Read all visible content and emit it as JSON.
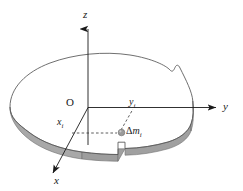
{
  "figure": {
    "kind": "3d-coordinate-diagram",
    "background_color": "#ffffff",
    "outline_color": "#4d4d4d",
    "axis_color": "#1a1a1a",
    "slab_edge_fill": "#a8a8a8",
    "slab_edge_shadow": "#7d7d7d",
    "point_marker_color": "#9a9a9a",
    "dashed_color": "#3c3c3c"
  },
  "axes": {
    "z": {
      "label": "z",
      "direction": "up"
    },
    "y": {
      "label": "y",
      "direction": "right"
    },
    "x": {
      "label": "x",
      "direction": "down-left"
    },
    "origin": {
      "label": "O"
    }
  },
  "annotations": {
    "x_coordinate": {
      "label": "x",
      "subscript": "i"
    },
    "y_coordinate": {
      "label": "y",
      "subscript": "i"
    },
    "mass_element": {
      "delta": "Δ",
      "label": "m",
      "subscript": "i"
    }
  }
}
